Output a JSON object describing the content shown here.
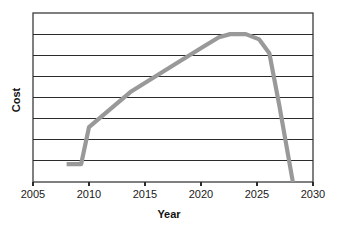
{
  "chart_data": {
    "type": "line",
    "title": "",
    "xlabel": "Year",
    "ylabel": "Cost",
    "xlim": [
      2005,
      2030
    ],
    "ylim": [
      0,
      8
    ],
    "grid": true,
    "legend": false,
    "xticks": [
      "2005",
      "2010",
      "2015",
      "2020",
      "2025",
      "2030"
    ],
    "xtick_values": [
      2005,
      2010,
      2015,
      2020,
      2025,
      2030
    ],
    "yticks": [],
    "ytick_values": [
      1,
      2,
      3,
      4,
      5,
      6,
      7
    ],
    "series": [
      {
        "name": "Cost",
        "color": "#999999",
        "x": [
          2008.0,
          2009.3,
          2010.0,
          2013.8,
          2017.6,
          2020.2,
          2021.6,
          2022.6,
          2024.0,
          2025.2,
          2026.1,
          2027.0,
          2028.2
        ],
        "y": [
          0.85,
          0.85,
          2.6,
          4.3,
          5.55,
          6.4,
          6.85,
          7.0,
          7.0,
          6.75,
          6.1,
          3.6,
          0.0
        ]
      }
    ],
    "axis_colors": {
      "frame": "#2b2b2b",
      "gridline": "#2b2b2b",
      "text": "#1a1a1a"
    },
    "plot_area": {
      "left": 33,
      "right": 313,
      "top": 13,
      "bottom": 182
    }
  }
}
